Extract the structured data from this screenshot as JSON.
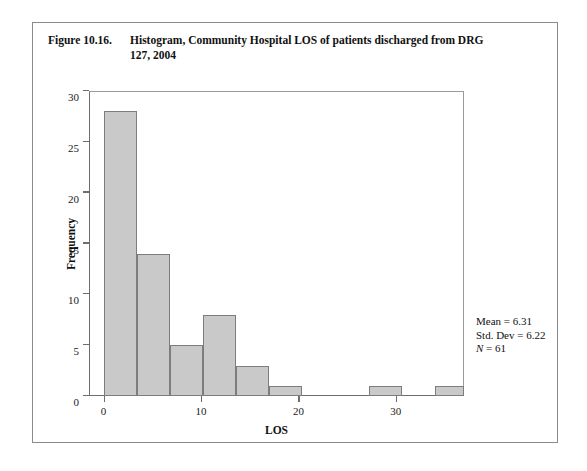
{
  "figure": {
    "label": "Figure 10.16.",
    "title": "Histogram, Community Hospital LOS of patients discharged from DRG 127, 2004"
  },
  "stats": {
    "mean": "Mean = 6.31",
    "std_dev": "Std. Dev = 6.22",
    "n_prefix": "N",
    "n_value": " = 61"
  },
  "colors": {
    "bar_fill": "#c9c9c9",
    "bar_stroke": "#7d7d7d",
    "axis": "#6e6e6e",
    "frame": "#8b8b8b",
    "text": "#111111"
  },
  "chart_data": {
    "type": "bar",
    "title": "Histogram, Community Hospital LOS of patients discharged from DRG 127, 2004",
    "xlabel": "LOS",
    "ylabel": "Frequency",
    "xlim": [
      -1.5,
      37
    ],
    "ylim": [
      0,
      30
    ],
    "grid": false,
    "legend": null,
    "bin_width": 3.4,
    "x_ticks": [
      0,
      10,
      20,
      30
    ],
    "x_tick_labels": [
      "0",
      "10",
      "20",
      "30"
    ],
    "y_ticks": [
      0,
      5,
      10,
      15,
      20,
      25,
      30
    ],
    "y_tick_labels": [
      "0",
      "5",
      "10",
      "15",
      "20",
      "25",
      "30"
    ],
    "bins": [
      {
        "x0": 0.0,
        "x1": 3.4,
        "value": 28
      },
      {
        "x0": 3.4,
        "x1": 6.8,
        "value": 14
      },
      {
        "x0": 6.8,
        "x1": 10.2,
        "value": 5
      },
      {
        "x0": 10.2,
        "x1": 13.6,
        "value": 8
      },
      {
        "x0": 13.6,
        "x1": 17.0,
        "value": 3
      },
      {
        "x0": 17.0,
        "x1": 20.4,
        "value": 1
      },
      {
        "x0": 27.2,
        "x1": 30.6,
        "value": 1
      },
      {
        "x0": 34.0,
        "x1": 37.0,
        "value": 1
      }
    ],
    "annotations": [
      "Mean = 6.31",
      "Std. Dev = 6.22",
      "N = 61"
    ]
  }
}
